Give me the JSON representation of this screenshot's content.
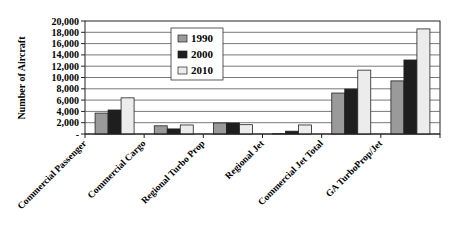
{
  "chart_data": {
    "type": "bar",
    "title": "",
    "xlabel": "",
    "ylabel": "Number of Aircraft",
    "ylim": [
      0,
      20000
    ],
    "yticks": [
      0,
      2000,
      4000,
      6000,
      8000,
      10000,
      12000,
      14000,
      16000,
      18000,
      20000
    ],
    "ytick_labels": [
      "-",
      "2,000",
      "4,000",
      "6,000",
      "8,000",
      "10,000",
      "12,000",
      "14,000",
      "16,000",
      "18,000",
      "20,000"
    ],
    "grid": true,
    "legend_position": "upper-center-left (inside plot)",
    "categories": [
      "Commercial Passenger",
      "Commercial Cargo",
      "Regional Turbo Prop",
      "Regional Jet",
      "Commercial Jet Total",
      "GA TurboProp/Jet"
    ],
    "series": [
      {
        "name": "1990",
        "color": "#9a9a9a",
        "values": [
          3700,
          1450,
          1950,
          50,
          7250,
          9400
        ]
      },
      {
        "name": "2000",
        "color": "#1e1e1e",
        "values": [
          4250,
          900,
          1950,
          500,
          7950,
          13100
        ]
      },
      {
        "name": "2010",
        "color": "#ececec",
        "values": [
          6400,
          1600,
          1650,
          1600,
          11300,
          18600
        ]
      }
    ]
  }
}
